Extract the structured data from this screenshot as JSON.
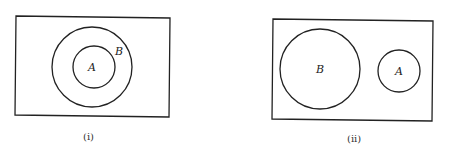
{
  "diagrams": [
    {
      "caption": "(i)",
      "description": "A is a subset of B",
      "sets": [
        {
          "label": "B",
          "role": "outer"
        },
        {
          "label": "A",
          "role": "inner"
        }
      ]
    },
    {
      "caption": "(ii)",
      "description": "A and B are disjoint",
      "sets": [
        {
          "label": "B",
          "role": "left"
        },
        {
          "label": "A",
          "role": "right"
        }
      ]
    }
  ],
  "colors": {
    "stroke": "#222222",
    "background": "#ffffff"
  }
}
